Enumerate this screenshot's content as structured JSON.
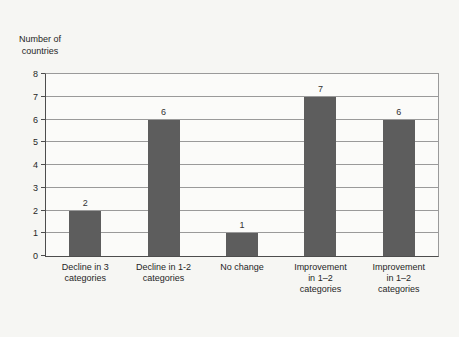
{
  "figure": {
    "background": "#f6f6f3"
  },
  "chart_data": {
    "type": "bar",
    "title": "",
    "ylabel": "Number of\ncountries",
    "xlabel": "",
    "categories": [
      "Decline in 3\ncategories",
      "Decline in 1-2\ncategories",
      "No change",
      "Improvement\nin 1–2\ncategories",
      "Improvement\nin 1–2\ncategories"
    ],
    "values": [
      2,
      6,
      1,
      7,
      6
    ],
    "value_labels_shown": true,
    "ylim": [
      0,
      8
    ],
    "ytick_step": 1,
    "grid": true,
    "legend_position": "none",
    "bar_color": "#5d5d5d",
    "gridline_color": "#9a9a9a",
    "axis_color": "#4d4d4d",
    "text_color": "#262626"
  }
}
